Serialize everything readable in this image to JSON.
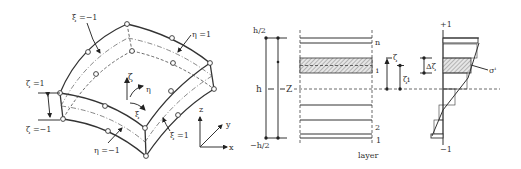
{
  "figure": {
    "shell_element": {
      "labels": {
        "xi_minus": "ξ =−1",
        "xi_plus": "ξ =1",
        "eta_plus": "η =1",
        "eta_minus": "η =−1",
        "zeta_plus": "ζ =1",
        "zeta_minus": "ζ =−1",
        "local_zeta": "ζ",
        "local_eta": "η",
        "local_xi": "ξ"
      },
      "global_axes": {
        "z": "z",
        "y": "y",
        "x": "x"
      }
    },
    "layer_stack": {
      "top_label": "h/2",
      "thickness_label": "h",
      "mid_label": "Z",
      "bottom_label": "−h/2",
      "layer_labels": [
        "n",
        "i",
        "2",
        "1"
      ],
      "axis_label": "layer",
      "zeta_label": "ζ",
      "zeta_i_label": "ζi"
    },
    "stress_profile": {
      "top_label": "+1",
      "bottom_label": "−1",
      "delta_label": "Δζ",
      "sigma_label": "σⁱ"
    }
  }
}
